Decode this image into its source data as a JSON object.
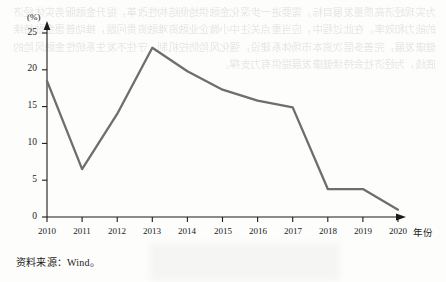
{
  "figure": {
    "y_unit_label": "(%)",
    "x_axis_title": "年份",
    "source_prefix": "资料来源：",
    "source_value": "Wind",
    "source_suffix": "。"
  },
  "colors": {
    "line": "#6e6e6e",
    "axis": "#1b1b1b",
    "text": "#1b1b1b",
    "page_background": "#fdfdfc"
  },
  "background_bleed_text": "为实现经济高质量发展目标，需要进一步深化金融供给侧结构性改革，提升金融服务实体经济的能力和效率。在此过程中，应当重点关注中小微企业融资难融资贵问题，推动普惠金融持续健康发展，完善多层次资本市场体系建设，强化风险防控机制，守住不发生系统性金融风险的底线，为经济社会持续健康发展提供有力支撑。",
  "chart_data": {
    "type": "line",
    "title": "",
    "xlabel": "年份",
    "ylabel": "(%)",
    "categories": [
      "2010",
      "2011",
      "2012",
      "2013",
      "2014",
      "2015",
      "2016",
      "2017",
      "2018",
      "2019",
      "2020"
    ],
    "x": [
      2010,
      2011,
      2012,
      2013,
      2014,
      2015,
      2016,
      2017,
      2018,
      2019,
      2020
    ],
    "values": [
      18.5,
      6.5,
      14.0,
      23.0,
      19.8,
      17.3,
      15.8,
      14.9,
      3.8,
      3.8,
      1.0
    ],
    "ylim": [
      0,
      25
    ],
    "yticks": [
      0,
      5,
      10,
      15,
      20,
      25
    ],
    "ytick_labels": [
      "0",
      "5",
      "10",
      "15",
      "20",
      "25"
    ],
    "grid": false,
    "legend": null,
    "series": [
      {
        "name": "",
        "values": [
          18.5,
          6.5,
          14.0,
          23.0,
          19.8,
          17.3,
          15.8,
          14.9,
          3.8,
          3.8,
          1.0
        ]
      }
    ]
  }
}
